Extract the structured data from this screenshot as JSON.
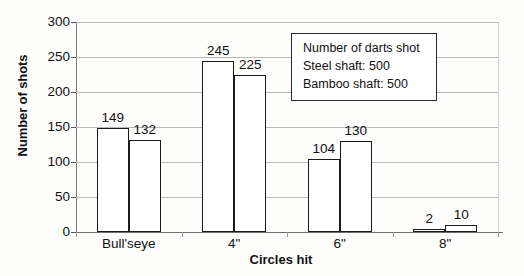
{
  "chart_data": {
    "type": "bar",
    "title": "",
    "xlabel": "Circles hit",
    "ylabel": "Number of shots",
    "categories": [
      "Bull'seye",
      "4\"",
      "6\"",
      "8\""
    ],
    "series": [
      {
        "name": "Steel shaft",
        "values": [
          149,
          245,
          104,
          2
        ]
      },
      {
        "name": "Bamboo shaft",
        "values": [
          132,
          225,
          130,
          10
        ]
      }
    ],
    "ylim": [
      0,
      300
    ],
    "yticks": [
      0,
      50,
      100,
      150,
      200,
      250,
      300
    ],
    "ytick_labels": [
      "0",
      "50",
      "100",
      "150",
      "200",
      "250",
      "300"
    ],
    "grid": true,
    "legend_position": "inside-top-right",
    "data_labels": true,
    "bar_fill": "#ffffff",
    "bar_edge": "#1a1a1a",
    "gridline_color": "#b9b9b9"
  },
  "annotation": {
    "lines": [
      "Number of darts shot",
      "Steel shaft: 500",
      "Bamboo shaft: 500"
    ]
  }
}
